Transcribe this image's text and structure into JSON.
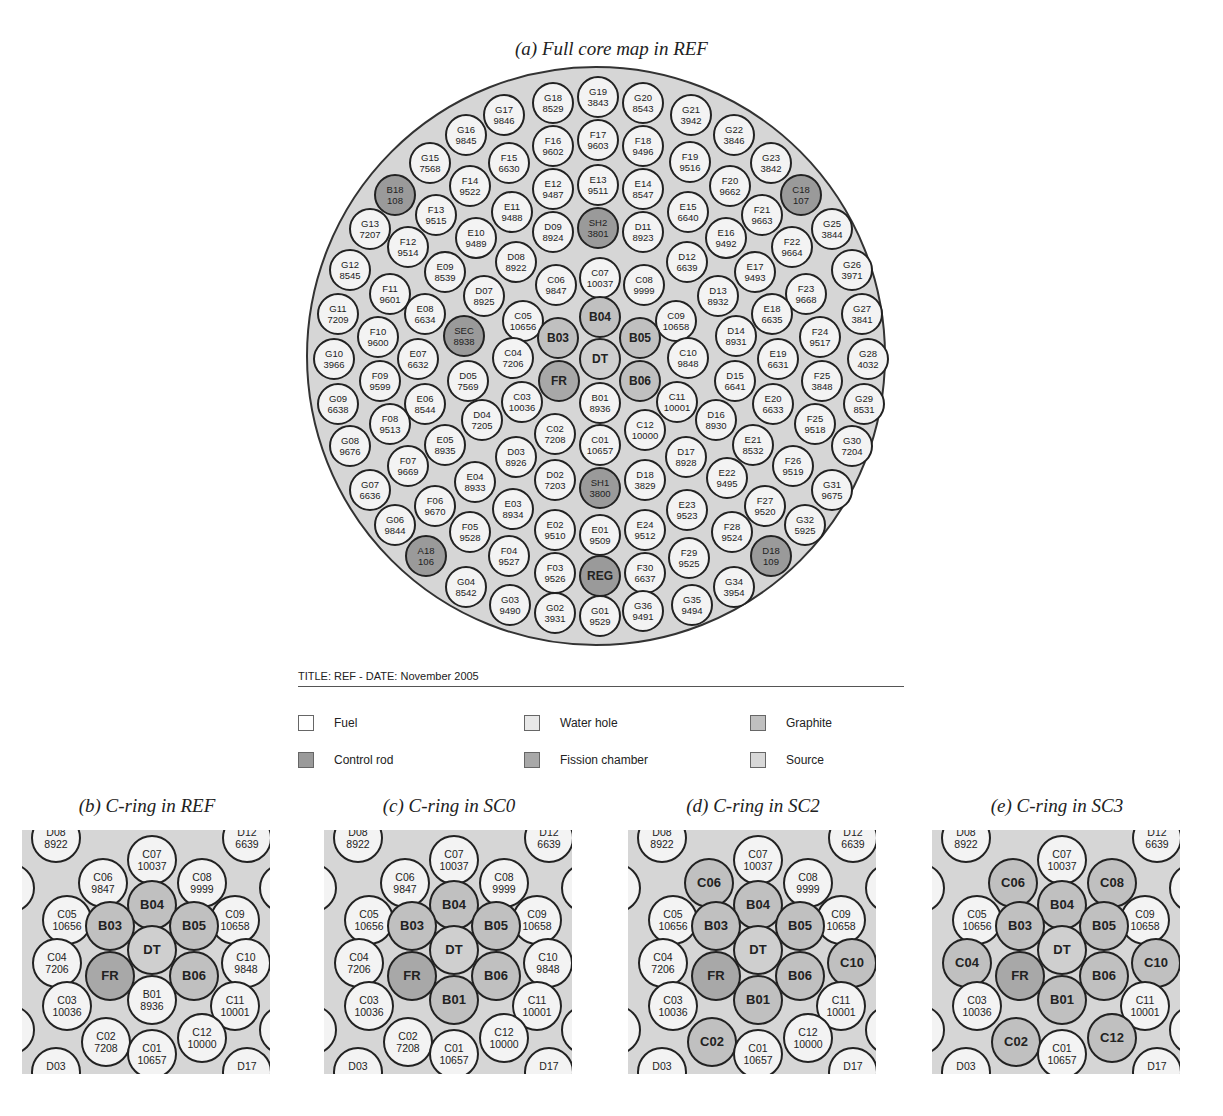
{
  "figure": {
    "main_caption": "(a) Full core map in REF",
    "title_line": "TITLE: REF - DATE: November 2005",
    "legend": [
      {
        "label": "Fuel",
        "type": "fuel",
        "color": "#ffffff"
      },
      {
        "label": "Water hole",
        "type": "water",
        "color": "#e8e8e8"
      },
      {
        "label": "Graphite",
        "type": "graphite",
        "color": "#c0c0c0"
      },
      {
        "label": "Control rod",
        "type": "control",
        "color": "#9a9a9a"
      },
      {
        "label": "Fission chamber",
        "type": "fission",
        "color": "#a8a8a8"
      },
      {
        "label": "Source",
        "type": "source",
        "color": "#d8d8d8"
      }
    ],
    "core_cells": [
      {
        "id": "G18",
        "v": "8529",
        "x": 553,
        "y": 103
      },
      {
        "id": "G19",
        "v": "3843",
        "x": 598,
        "y": 97
      },
      {
        "id": "G20",
        "v": "8543",
        "x": 643,
        "y": 103
      },
      {
        "id": "G17",
        "v": "9846",
        "x": 504,
        "y": 115
      },
      {
        "id": "G21",
        "v": "3942",
        "x": 691,
        "y": 115
      },
      {
        "id": "G16",
        "v": "9845",
        "x": 466,
        "y": 135
      },
      {
        "id": "G22",
        "v": "3846",
        "x": 734,
        "y": 135
      },
      {
        "id": "F16",
        "v": "9602",
        "x": 553,
        "y": 146
      },
      {
        "id": "F17",
        "v": "9603",
        "x": 598,
        "y": 140
      },
      {
        "id": "F18",
        "v": "9496",
        "x": 643,
        "y": 146
      },
      {
        "id": "F15",
        "v": "6630",
        "x": 509,
        "y": 163
      },
      {
        "id": "F19",
        "v": "9516",
        "x": 690,
        "y": 162
      },
      {
        "id": "G15",
        "v": "7568",
        "x": 430,
        "y": 163
      },
      {
        "id": "G23",
        "v": "3842",
        "x": 771,
        "y": 163
      },
      {
        "id": "F14",
        "v": "9522",
        "x": 470,
        "y": 186
      },
      {
        "id": "F20",
        "v": "9662",
        "x": 730,
        "y": 186
      },
      {
        "id": "E12",
        "v": "9487",
        "x": 553,
        "y": 189
      },
      {
        "id": "E13",
        "v": "9511",
        "x": 598,
        "y": 185
      },
      {
        "id": "E14",
        "v": "8547",
        "x": 643,
        "y": 189
      },
      {
        "id": "B18",
        "v": "108",
        "x": 395,
        "y": 195,
        "t": "control"
      },
      {
        "id": "C18",
        "v": "107",
        "x": 801,
        "y": 195,
        "t": "control"
      },
      {
        "id": "E11",
        "v": "9488",
        "x": 512,
        "y": 212
      },
      {
        "id": "E15",
        "v": "6640",
        "x": 688,
        "y": 212
      },
      {
        "id": "F13",
        "v": "9515",
        "x": 436,
        "y": 215
      },
      {
        "id": "F21",
        "v": "9663",
        "x": 762,
        "y": 215
      },
      {
        "id": "G13",
        "v": "7207",
        "x": 370,
        "y": 229
      },
      {
        "id": "G25",
        "v": "3844",
        "x": 832,
        "y": 229
      },
      {
        "id": "E10",
        "v": "9489",
        "x": 476,
        "y": 238
      },
      {
        "id": "E16",
        "v": "9492",
        "x": 726,
        "y": 238
      },
      {
        "id": "D09",
        "v": "8924",
        "x": 553,
        "y": 232
      },
      {
        "id": "SH2",
        "v": "3801",
        "x": 598,
        "y": 228,
        "t": "control"
      },
      {
        "id": "D11",
        "v": "8923",
        "x": 643,
        "y": 232
      },
      {
        "id": "F12",
        "v": "9514",
        "x": 408,
        "y": 247
      },
      {
        "id": "F22",
        "v": "9664",
        "x": 792,
        "y": 247
      },
      {
        "id": "D08",
        "v": "8922",
        "x": 516,
        "y": 262
      },
      {
        "id": "D12",
        "v": "6639",
        "x": 687,
        "y": 262
      },
      {
        "id": "E09",
        "v": "8539",
        "x": 445,
        "y": 272
      },
      {
        "id": "E17",
        "v": "9493",
        "x": 755,
        "y": 272
      },
      {
        "id": "G12",
        "v": "8545",
        "x": 350,
        "y": 270
      },
      {
        "id": "G26",
        "v": "3971",
        "x": 852,
        "y": 270
      },
      {
        "id": "C06",
        "v": "9847",
        "x": 556,
        "y": 285
      },
      {
        "id": "C07",
        "v": "10037",
        "x": 600,
        "y": 278
      },
      {
        "id": "C08",
        "v": "9999",
        "x": 644,
        "y": 285
      },
      {
        "id": "D07",
        "v": "8925",
        "x": 484,
        "y": 296
      },
      {
        "id": "D13",
        "v": "8932",
        "x": 718,
        "y": 296
      },
      {
        "id": "F11",
        "v": "9601",
        "x": 390,
        "y": 294
      },
      {
        "id": "F23",
        "v": "9668",
        "x": 806,
        "y": 294
      },
      {
        "id": "E08",
        "v": "6634",
        "x": 425,
        "y": 314
      },
      {
        "id": "E18",
        "v": "6635",
        "x": 772,
        "y": 314
      },
      {
        "id": "G11",
        "v": "7209",
        "x": 338,
        "y": 314
      },
      {
        "id": "G27",
        "v": "3841",
        "x": 862,
        "y": 314
      },
      {
        "id": "C05",
        "v": "10656",
        "x": 523,
        "y": 321
      },
      {
        "id": "C09",
        "v": "10658",
        "x": 676,
        "y": 321
      },
      {
        "id": "B04",
        "v": "",
        "x": 600,
        "y": 317,
        "t": "graphite"
      },
      {
        "id": "B03",
        "v": "",
        "x": 558,
        "y": 338,
        "t": "graphite"
      },
      {
        "id": "B05",
        "v": "",
        "x": 640,
        "y": 338,
        "t": "graphite"
      },
      {
        "id": "SEC",
        "v": "8938",
        "x": 464,
        "y": 336,
        "t": "control"
      },
      {
        "id": "D14",
        "v": "8931",
        "x": 736,
        "y": 336
      },
      {
        "id": "F10",
        "v": "9600",
        "x": 378,
        "y": 337
      },
      {
        "id": "F24",
        "v": "9517",
        "x": 820,
        "y": 337
      },
      {
        "id": "DT",
        "v": "",
        "x": 600,
        "y": 359,
        "t": "source"
      },
      {
        "id": "C04",
        "v": "7206",
        "x": 513,
        "y": 358
      },
      {
        "id": "C10",
        "v": "9848",
        "x": 688,
        "y": 358
      },
      {
        "id": "E07",
        "v": "6632",
        "x": 418,
        "y": 359
      },
      {
        "id": "E19",
        "v": "6631",
        "x": 778,
        "y": 359
      },
      {
        "id": "G10",
        "v": "3966",
        "x": 334,
        "y": 359
      },
      {
        "id": "G28",
        "v": "4032",
        "x": 868,
        "y": 359
      },
      {
        "id": "FR",
        "v": "",
        "x": 559,
        "y": 381,
        "t": "fission"
      },
      {
        "id": "B06",
        "v": "",
        "x": 640,
        "y": 381,
        "t": "graphite"
      },
      {
        "id": "D05",
        "v": "7569",
        "x": 468,
        "y": 381
      },
      {
        "id": "D15",
        "v": "6641",
        "x": 735,
        "y": 381
      },
      {
        "id": "F09",
        "v": "9599",
        "x": 380,
        "y": 381
      },
      {
        "id": "F25",
        "v": "3848",
        "x": 822,
        "y": 381
      },
      {
        "id": "C03",
        "v": "10036",
        "x": 522,
        "y": 402
      },
      {
        "id": "C11",
        "v": "10001",
        "x": 677,
        "y": 402
      },
      {
        "id": "B01",
        "v": "8936",
        "x": 600,
        "y": 403
      },
      {
        "id": "E06",
        "v": "8544",
        "x": 425,
        "y": 404
      },
      {
        "id": "E20",
        "v": "6633",
        "x": 773,
        "y": 404
      },
      {
        "id": "G09",
        "v": "6638",
        "x": 338,
        "y": 404
      },
      {
        "id": "G29",
        "v": "8531",
        "x": 864,
        "y": 404
      },
      {
        "id": "D04",
        "v": "7205",
        "x": 482,
        "y": 420
      },
      {
        "id": "D16",
        "v": "8930",
        "x": 716,
        "y": 420
      },
      {
        "id": "F08",
        "v": "9513",
        "x": 390,
        "y": 424
      },
      {
        "id": "F25",
        "v": "9518",
        "x": 815,
        "y": 424
      },
      {
        "id": "C02",
        "v": "7208",
        "x": 555,
        "y": 434
      },
      {
        "id": "C12",
        "v": "10000",
        "x": 645,
        "y": 430
      },
      {
        "id": "C01",
        "v": "10657",
        "x": 600,
        "y": 445
      },
      {
        "id": "E05",
        "v": "8935",
        "x": 445,
        "y": 445
      },
      {
        "id": "E21",
        "v": "8532",
        "x": 753,
        "y": 445
      },
      {
        "id": "G08",
        "v": "9676",
        "x": 350,
        "y": 446
      },
      {
        "id": "G30",
        "v": "7204",
        "x": 852,
        "y": 446
      },
      {
        "id": "D03",
        "v": "8926",
        "x": 516,
        "y": 457
      },
      {
        "id": "D17",
        "v": "8928",
        "x": 686,
        "y": 457
      },
      {
        "id": "F07",
        "v": "9669",
        "x": 408,
        "y": 466
      },
      {
        "id": "F26",
        "v": "9519",
        "x": 793,
        "y": 466
      },
      {
        "id": "E04",
        "v": "8933",
        "x": 475,
        "y": 482
      },
      {
        "id": "E22",
        "v": "9495",
        "x": 727,
        "y": 478
      },
      {
        "id": "D02",
        "v": "7203",
        "x": 555,
        "y": 480
      },
      {
        "id": "D18",
        "v": "3829",
        "x": 645,
        "y": 480
      },
      {
        "id": "SH1",
        "v": "3800",
        "x": 600,
        "y": 488,
        "t": "control"
      },
      {
        "id": "G07",
        "v": "6636",
        "x": 370,
        "y": 490
      },
      {
        "id": "G31",
        "v": "9675",
        "x": 832,
        "y": 490
      },
      {
        "id": "F06",
        "v": "9670",
        "x": 435,
        "y": 506
      },
      {
        "id": "F27",
        "v": "9520",
        "x": 765,
        "y": 506
      },
      {
        "id": "E03",
        "v": "8934",
        "x": 513,
        "y": 509
      },
      {
        "id": "E23",
        "v": "9523",
        "x": 687,
        "y": 510
      },
      {
        "id": "G06",
        "v": "9844",
        "x": 395,
        "y": 525
      },
      {
        "id": "G32",
        "v": "5925",
        "x": 805,
        "y": 525
      },
      {
        "id": "E02",
        "v": "9510",
        "x": 555,
        "y": 530
      },
      {
        "id": "E24",
        "v": "9512",
        "x": 645,
        "y": 530
      },
      {
        "id": "E01",
        "v": "9509",
        "x": 600,
        "y": 535
      },
      {
        "id": "F05",
        "v": "9528",
        "x": 470,
        "y": 532
      },
      {
        "id": "F28",
        "v": "9524",
        "x": 732,
        "y": 532
      },
      {
        "id": "A18",
        "v": "106",
        "x": 426,
        "y": 556,
        "t": "control"
      },
      {
        "id": "D18",
        "v": "109",
        "x": 771,
        "y": 556,
        "t": "control"
      },
      {
        "id": "F04",
        "v": "9527",
        "x": 509,
        "y": 556
      },
      {
        "id": "F29",
        "v": "9525",
        "x": 689,
        "y": 558
      },
      {
        "id": "F03",
        "v": "9526",
        "x": 555,
        "y": 573
      },
      {
        "id": "F30",
        "v": "6637",
        "x": 645,
        "y": 573
      },
      {
        "id": "REG",
        "v": "",
        "x": 600,
        "y": 576,
        "t": "control"
      },
      {
        "id": "G04",
        "v": "8542",
        "x": 466,
        "y": 587
      },
      {
        "id": "G34",
        "v": "3954",
        "x": 734,
        "y": 587
      },
      {
        "id": "G03",
        "v": "9490",
        "x": 510,
        "y": 605
      },
      {
        "id": "G35",
        "v": "9494",
        "x": 692,
        "y": 605
      },
      {
        "id": "G02",
        "v": "3931",
        "x": 555,
        "y": 613
      },
      {
        "id": "G36",
        "v": "9491",
        "x": 643,
        "y": 611
      },
      {
        "id": "G01",
        "v": "9529",
        "x": 600,
        "y": 616
      }
    ],
    "panels": [
      {
        "caption": "(b) C-ring in REF",
        "left": 22,
        "converted": [],
        "b01_graphite": false
      },
      {
        "caption": "(c) C-ring in SC0",
        "left": 324,
        "converted": [],
        "b01_graphite": true
      },
      {
        "caption": "(d) C-ring in SC2",
        "left": 628,
        "converted": [
          "C06",
          "C10",
          "C02"
        ],
        "b01_graphite": true
      },
      {
        "caption": "(e) C-ring in SC3",
        "left": 932,
        "converted": [
          "C06",
          "C08",
          "C04",
          "C10",
          "C02",
          "C12"
        ],
        "b01_graphite": true
      }
    ],
    "panel_cells": [
      {
        "id": "D08",
        "v": "8922",
        "x": 34,
        "y": 8
      },
      {
        "id": "D12",
        "v": "6639",
        "x": 225,
        "y": 8
      },
      {
        "id": "C07",
        "v": "10037",
        "x": 130,
        "y": 30
      },
      {
        "id": "C06",
        "v": "9847",
        "x": 81,
        "y": 53
      },
      {
        "id": "C08",
        "v": "9999",
        "x": 180,
        "y": 53
      },
      {
        "id": "D07",
        "v": "8925",
        "x": -12,
        "y": 58
      },
      {
        "id": "D13",
        "v": "8932",
        "x": 262,
        "y": 58
      },
      {
        "id": "C05",
        "v": "10656",
        "x": 45,
        "y": 90
      },
      {
        "id": "C09",
        "v": "10658",
        "x": 213,
        "y": 90
      },
      {
        "id": "B04",
        "v": "",
        "x": 130,
        "y": 75,
        "t": "graphite"
      },
      {
        "id": "B03",
        "v": "",
        "x": 88,
        "y": 96,
        "t": "graphite"
      },
      {
        "id": "B05",
        "v": "",
        "x": 172,
        "y": 96,
        "t": "graphite"
      },
      {
        "id": "C04",
        "v": "7206",
        "x": 35,
        "y": 133
      },
      {
        "id": "DT",
        "v": "",
        "x": 130,
        "y": 120,
        "t": "source"
      },
      {
        "id": "C10",
        "v": "9848",
        "x": 224,
        "y": 133
      },
      {
        "id": "FR",
        "v": "",
        "x": 88,
        "y": 146,
        "t": "fission"
      },
      {
        "id": "B06",
        "v": "",
        "x": 172,
        "y": 146,
        "t": "graphite"
      },
      {
        "id": "C03",
        "v": "10036",
        "x": 45,
        "y": 176
      },
      {
        "id": "B01",
        "v": "8936",
        "x": 130,
        "y": 170
      },
      {
        "id": "C11",
        "v": "10001",
        "x": 213,
        "y": 176
      },
      {
        "id": "D04",
        "v": "7205",
        "x": -12,
        "y": 200
      },
      {
        "id": "D16",
        "v": "8930",
        "x": 262,
        "y": 200
      },
      {
        "id": "C02",
        "v": "7208",
        "x": 84,
        "y": 212
      },
      {
        "id": "C12",
        "v": "10000",
        "x": 180,
        "y": 208
      },
      {
        "id": "C01",
        "v": "10657",
        "x": 130,
        "y": 224
      },
      {
        "id": "D03",
        "v": "8926",
        "x": 34,
        "y": 242
      },
      {
        "id": "D17",
        "v": "8928",
        "x": 225,
        "y": 242
      }
    ]
  }
}
